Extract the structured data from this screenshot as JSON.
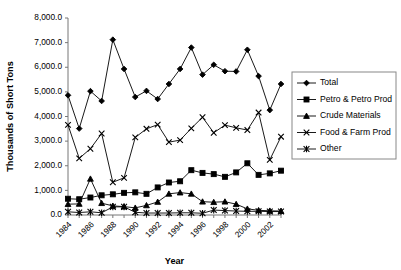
{
  "chart_data": {
    "type": "line",
    "title": "",
    "xlabel": "Year",
    "ylabel": "Thousands of Short Tons",
    "ylim": [
      0,
      8000
    ],
    "xlim": [
      1984,
      2003
    ],
    "grid": false,
    "legend_position": "right",
    "y_ticks": [
      0,
      1000,
      2000,
      3000,
      4000,
      5000,
      6000,
      7000,
      8000
    ],
    "y_tick_labels": [
      "0.0",
      "1,000.0",
      "2,000.0",
      "3,000.0",
      "4,000.0",
      "5,000.0",
      "6,000.0",
      "7,000.0",
      "8,000.0"
    ],
    "x": [
      1984,
      1985,
      1986,
      1987,
      1988,
      1989,
      1990,
      1991,
      1992,
      1993,
      1994,
      1995,
      1996,
      1997,
      1998,
      1999,
      2000,
      2001,
      2002,
      2003
    ],
    "x_tick_labels": [
      "1984",
      "1986",
      "1988",
      "1990",
      "1992",
      "1994",
      "1996",
      "1998",
      "2000",
      "2002"
    ],
    "x_tick_values": [
      1984,
      1986,
      1988,
      1990,
      1992,
      1994,
      1996,
      1998,
      2000,
      2002
    ],
    "series": [
      {
        "name": "Total",
        "marker": "diamond",
        "values": [
          4860,
          3510,
          5030,
          4630,
          7120,
          5930,
          4790,
          5040,
          4710,
          5320,
          5930,
          6800,
          5700,
          6100,
          5840,
          5830,
          6710,
          5640,
          4260,
          5320
        ]
      },
      {
        "name": "Petro & Petro Prod",
        "marker": "square",
        "values": [
          660,
          640,
          710,
          800,
          840,
          900,
          920,
          860,
          1120,
          1320,
          1370,
          1820,
          1710,
          1660,
          1550,
          1730,
          2100,
          1630,
          1690,
          1800
        ]
      },
      {
        "name": "Crude Materials",
        "marker": "triangle",
        "values": [
          440,
          450,
          1470,
          480,
          370,
          340,
          290,
          390,
          530,
          860,
          910,
          860,
          540,
          520,
          540,
          440,
          250,
          190,
          170,
          160
        ]
      },
      {
        "name": "Food & Farm Prod",
        "marker": "x",
        "values": [
          3660,
          2300,
          2690,
          3310,
          1330,
          1510,
          3150,
          3500,
          3670,
          2960,
          3040,
          3520,
          3970,
          3340,
          3650,
          3540,
          3450,
          4160,
          2240,
          3180
        ]
      },
      {
        "name": "Other",
        "marker": "asterisk",
        "values": [
          130,
          100,
          130,
          90,
          330,
          330,
          110,
          80,
          80,
          80,
          90,
          90,
          70,
          200,
          180,
          160,
          150,
          150,
          140,
          140
        ]
      }
    ]
  }
}
